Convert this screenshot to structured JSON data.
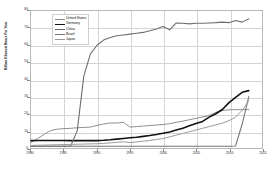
{
  "chart_data": {
    "type": "line",
    "title": "",
    "subtitle": "",
    "xlabel": "",
    "ylabel": "Billion Kilowatt Hours Per Year",
    "xlim": [
      1980,
      2015
    ],
    "ylim": [
      0,
      80
    ],
    "grid": true,
    "legend_position": "top-left",
    "x_ticks": [
      "1980",
      "1985",
      "1990",
      "1995",
      "2000",
      "2005",
      "2010",
      "2015"
    ],
    "y_ticks": [
      "0",
      "10",
      "20",
      "30",
      "40",
      "50",
      "60",
      "70",
      "80"
    ],
    "x": [
      1980,
      1981,
      1982,
      1983,
      1984,
      1985,
      1986,
      1987,
      1988,
      1989,
      1990,
      1991,
      1992,
      1993,
      1994,
      1995,
      1996,
      1997,
      1998,
      1999,
      2000,
      2001,
      2002,
      2003,
      2004,
      2005,
      2006,
      2007,
      2008,
      2009,
      2010,
      2011,
      2012,
      2013
    ],
    "series": [
      {
        "name": "United States",
        "color": "#8c8c8c",
        "width": 1.0,
        "values": [
          3.2,
          5.5,
          8.0,
          10.2,
          11.0,
          11.3,
          11.5,
          11.8,
          12.0,
          12.2,
          13.2,
          14.0,
          14.6,
          14.6,
          15.0,
          12.2,
          12.5,
          12.8,
          13.1,
          13.4,
          13.7,
          14.2,
          15.0,
          15.7,
          16.5,
          17.3,
          18.1,
          19.0,
          20.8,
          21.9,
          22.3,
          22.4,
          22.4,
          22.4
        ]
      },
      {
        "name": "Germany",
        "color": "#111111",
        "width": 1.6,
        "values": [
          4.3,
          4.4,
          4.4,
          4.4,
          4.4,
          4.4,
          4.3,
          4.3,
          4.3,
          4.3,
          4.3,
          4.5,
          4.8,
          5.2,
          5.6,
          6.0,
          6.3,
          6.8,
          7.3,
          7.9,
          8.6,
          9.4,
          10.5,
          11.5,
          13.0,
          14.3,
          15.5,
          18.0,
          20.0,
          22.5,
          26.5,
          29.5,
          32.5,
          33.5
        ]
      },
      {
        "name": "China",
        "color": "#6e6e6e",
        "width": 1.1,
        "values": [
          1.0,
          1.0,
          1.0,
          1.0,
          1.0,
          1.0,
          1.0,
          10.0,
          42.0,
          55.0,
          60.0,
          63.0,
          64.5,
          65.5,
          66.0,
          66.5,
          67.0,
          67.5,
          68.5,
          69.5,
          71.0,
          69.0,
          73.0,
          72.8,
          72.5,
          72.8,
          72.8,
          73.0,
          73.2,
          73.5,
          73.2,
          74.5,
          73.5,
          75.5
        ]
      },
      {
        "name": "Brazil",
        "color": "#767676",
        "width": 1.1,
        "values": [
          1.0,
          1.0,
          1.0,
          1.0,
          1.0,
          1.0,
          1.0,
          1.0,
          1.0,
          1.0,
          1.0,
          1.0,
          1.0,
          1.0,
          1.0,
          1.0,
          1.0,
          1.0,
          1.0,
          1.0,
          1.0,
          1.0,
          1.0,
          1.0,
          1.0,
          1.0,
          1.0,
          1.0,
          1.0,
          1.0,
          1.0,
          1.2,
          14.0,
          30.0
        ]
      },
      {
        "name": "Japan",
        "color": "#9a9a9a",
        "width": 1.0,
        "values": [
          1.5,
          1.6,
          1.7,
          1.8,
          1.9,
          2.0,
          2.1,
          2.2,
          2.3,
          2.4,
          2.5,
          2.7,
          3.0,
          3.3,
          3.6,
          3.2,
          3.5,
          4.0,
          4.4,
          5.0,
          5.5,
          6.5,
          7.5,
          8.5,
          9.5,
          10.5,
          11.5,
          12.5,
          13.5,
          14.5,
          16.0,
          18.0,
          22.0,
          27.5
        ]
      }
    ]
  },
  "legend": {
    "items": [
      {
        "label": "United States"
      },
      {
        "label": "Germany"
      },
      {
        "label": "China"
      },
      {
        "label": "Brazil"
      },
      {
        "label": "Japan"
      }
    ]
  }
}
